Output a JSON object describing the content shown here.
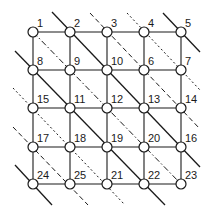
{
  "diagram": {
    "type": "grid-network",
    "colors": {
      "line": "#1a1a1a",
      "node_fill": "#ffffff",
      "background": "#ffffff"
    },
    "grid": {
      "columns_x": [
        33,
        70,
        107,
        144,
        181
      ],
      "rows_y": [
        32,
        70,
        108,
        147,
        184
      ],
      "node_radius": 5
    },
    "nodes": [
      {
        "label": "1",
        "row": 0,
        "col": 0
      },
      {
        "label": "2",
        "row": 0,
        "col": 1
      },
      {
        "label": "3",
        "row": 0,
        "col": 2
      },
      {
        "label": "4",
        "row": 0,
        "col": 3
      },
      {
        "label": "5",
        "row": 0,
        "col": 4
      },
      {
        "label": "8",
        "row": 1,
        "col": 0
      },
      {
        "label": "9",
        "row": 1,
        "col": 1
      },
      {
        "label": "10",
        "row": 1,
        "col": 2
      },
      {
        "label": "6",
        "row": 1,
        "col": 3
      },
      {
        "label": "7",
        "row": 1,
        "col": 4
      },
      {
        "label": "15",
        "row": 2,
        "col": 0
      },
      {
        "label": "11",
        "row": 2,
        "col": 1
      },
      {
        "label": "12",
        "row": 2,
        "col": 2
      },
      {
        "label": "13",
        "row": 2,
        "col": 3
      },
      {
        "label": "14",
        "row": 2,
        "col": 4
      },
      {
        "label": "17",
        "row": 3,
        "col": 0
      },
      {
        "label": "18",
        "row": 3,
        "col": 1
      },
      {
        "label": "19",
        "row": 3,
        "col": 2
      },
      {
        "label": "20",
        "row": 3,
        "col": 3
      },
      {
        "label": "16",
        "row": 3,
        "col": 4
      },
      {
        "label": "24",
        "row": 4,
        "col": 0
      },
      {
        "label": "25",
        "row": 4,
        "col": 1
      },
      {
        "label": "21",
        "row": 4,
        "col": 2
      },
      {
        "label": "22",
        "row": 4,
        "col": 3
      },
      {
        "label": "23",
        "row": 4,
        "col": 4
      }
    ],
    "diagonals": [
      {
        "style": "solid",
        "through": [
          "5"
        ],
        "x1": 163,
        "y1": 13,
        "x2": 200,
        "y2": 52
      },
      {
        "style": "dotted",
        "through": [
          "4",
          "7"
        ],
        "x1": 127,
        "y1": 13,
        "x2": 200,
        "y2": 90
      },
      {
        "style": "dashed",
        "through": [
          "3",
          "6",
          "14"
        ],
        "x1": 90,
        "y1": 13,
        "x2": 200,
        "y2": 129
      },
      {
        "style": "solid",
        "through": [
          "2",
          "10",
          "13",
          "16"
        ],
        "x1": 52,
        "y1": 12,
        "x2": 200,
        "y2": 167
      },
      {
        "style": "dash-dot",
        "through": [
          "1",
          "9",
          "12",
          "20",
          "23"
        ],
        "x1": 33,
        "y1": 32,
        "x2": 181,
        "y2": 184
      },
      {
        "style": "solid",
        "through": [
          "8",
          "11",
          "19",
          "22"
        ],
        "x1": 15,
        "y1": 51,
        "x2": 165,
        "y2": 205
      },
      {
        "style": "dotted",
        "through": [
          "15",
          "18",
          "21"
        ],
        "x1": 13,
        "y1": 88,
        "x2": 125,
        "y2": 205
      },
      {
        "style": "dashed",
        "through": [
          "17",
          "25"
        ],
        "x1": 13,
        "y1": 127,
        "x2": 88,
        "y2": 205
      },
      {
        "style": "solid",
        "through": [
          "24"
        ],
        "x1": 15,
        "y1": 165,
        "x2": 52,
        "y2": 205
      }
    ]
  }
}
